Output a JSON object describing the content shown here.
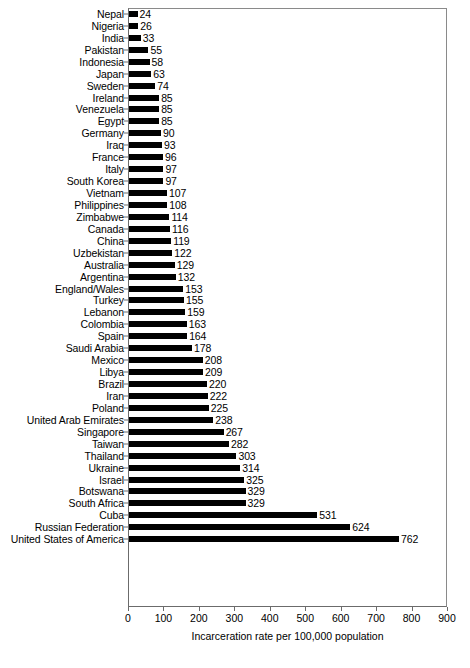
{
  "chart_data": {
    "type": "bar",
    "orientation": "horizontal",
    "title": "",
    "xlabel": "Incarceration rate per 100,000 population",
    "ylabel": "",
    "xlim": [
      0,
      900
    ],
    "xticks": [
      0,
      100,
      200,
      300,
      400,
      500,
      600,
      700,
      800,
      900
    ],
    "grid": false,
    "legend": false,
    "bar_color": "#000000",
    "show_value_labels": true,
    "categories": [
      "Nepal",
      "Nigeria",
      "India",
      "Pakistan",
      "Indonesia",
      "Japan",
      "Sweden",
      "Ireland",
      "Venezuela",
      "Egypt",
      "Germany",
      "Iraq",
      "France",
      "Italy",
      "South Korea",
      "Vietnam",
      "Philippines",
      "Zimbabwe",
      "Canada",
      "China",
      "Uzbekistan",
      "Australia",
      "Argentina",
      "England/Wales",
      "Turkey",
      "Lebanon",
      "Colombia",
      "Spain",
      "Saudi Arabia",
      "Mexico",
      "Libya",
      "Brazil",
      "Iran",
      "Poland",
      "United Arab Emirates",
      "Singapore",
      "Taiwan",
      "Thailand",
      "Ukraine",
      "Israel",
      "Botswana",
      "South Africa",
      "Cuba",
      "Russian Federation",
      "United States of America"
    ],
    "values": [
      24,
      26,
      33,
      55,
      58,
      63,
      74,
      85,
      85,
      85,
      90,
      93,
      96,
      97,
      97,
      107,
      108,
      114,
      116,
      119,
      122,
      129,
      132,
      153,
      155,
      159,
      163,
      164,
      178,
      208,
      209,
      220,
      222,
      225,
      238,
      267,
      282,
      303,
      314,
      325,
      329,
      329,
      531,
      624,
      762
    ]
  }
}
